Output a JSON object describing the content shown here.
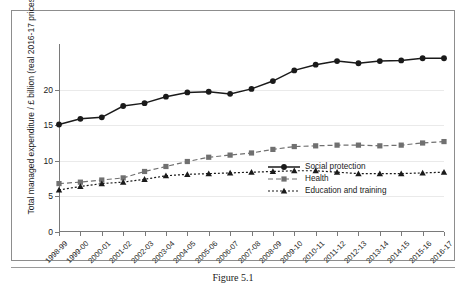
{
  "figure": {
    "caption": "Figure 5.1"
  },
  "chart_data": {
    "type": "line",
    "title": "",
    "xlabel": "",
    "ylabel": "Total managed expenditure / £ billion (real 2016-17 prices)",
    "ylim": [
      0,
      25
    ],
    "yticks": [
      0,
      5,
      10,
      15,
      20
    ],
    "ytick_labels": [
      "0",
      "5",
      "10",
      "15",
      "20"
    ],
    "grid": true,
    "legend_position": "bottom-right",
    "categories": [
      "1998-99",
      "1999-00",
      "2000-01",
      "2001-02",
      "2002-03",
      "2003-04",
      "2004-05",
      "2005-06",
      "2006-07",
      "2007-08",
      "2008-09",
      "2009-10",
      "2010-11",
      "2011-12",
      "2012-13",
      "2013-14",
      "2014-15",
      "2015-16",
      "2016-17"
    ],
    "series": [
      {
        "name": "Social protection",
        "marker": "circle",
        "line_style": "solid",
        "color": "#1a1a1a",
        "values": [
          15.1,
          15.9,
          16.1,
          17.7,
          18.1,
          19.0,
          19.6,
          19.7,
          19.4,
          20.1,
          21.2,
          22.7,
          23.5,
          24.0,
          23.7,
          24.0,
          24.1,
          24.4,
          24.4
        ]
      },
      {
        "name": "Health",
        "marker": "square",
        "line_style": "dashed",
        "color": "#707070",
        "values": [
          6.8,
          7.0,
          7.3,
          7.6,
          8.5,
          9.2,
          9.9,
          10.5,
          10.8,
          11.1,
          11.6,
          12.0,
          12.1,
          12.2,
          12.2,
          12.1,
          12.2,
          12.5,
          12.7
        ]
      },
      {
        "name": "Education and training",
        "marker": "triangle",
        "line_style": "dotted",
        "color": "#1a1a1a",
        "values": [
          5.9,
          6.4,
          6.8,
          7.0,
          7.4,
          7.9,
          8.1,
          8.2,
          8.3,
          8.4,
          8.5,
          8.6,
          8.6,
          8.4,
          8.2,
          8.2,
          8.2,
          8.3,
          8.4
        ]
      }
    ]
  }
}
